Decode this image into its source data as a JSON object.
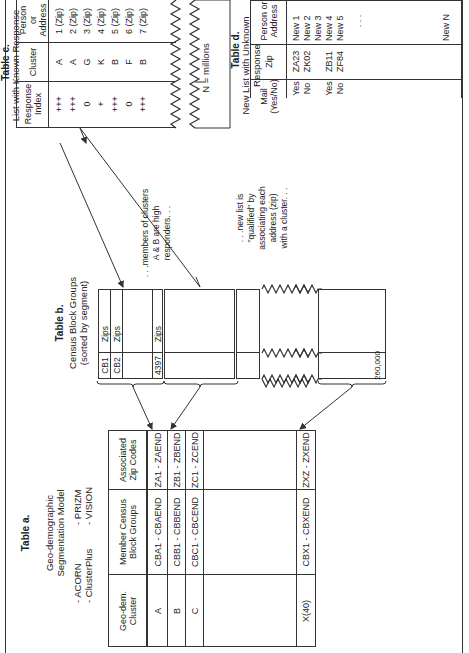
{
  "table_a": {
    "title": "Table a.",
    "subtitle_1": "Geo-demographic",
    "subtitle_2": "Segmentation Model",
    "models": [
      "- ACORN",
      "- PRIZM",
      "- ClusterPlus",
      "- VISION"
    ],
    "headers": [
      "Geo-dem. Cluster",
      "Member Census Block Groups",
      "Associated Zip Codes"
    ],
    "rows": [
      {
        "cluster": "A",
        "members": "CBA1 - CBAEND",
        "zips": "ZA1 - ZAEND"
      },
      {
        "cluster": "B",
        "members": "CBB1 - CBBEND",
        "zips": "ZB1 - ZBEND"
      },
      {
        "cluster": "C",
        "members": "CBC1 - CBCEND",
        "zips": "ZC1 - ZCEND"
      },
      {
        "cluster": "X(40)",
        "members": "CBX1 - CBXEND",
        "zips": "ZXZ - ZXEND"
      }
    ]
  },
  "table_b": {
    "title": "Table b.",
    "subtitle_1": "Census Block Groups",
    "subtitle_2": "(sorted by segment)",
    "rows": [
      {
        "id": "CB1",
        "value": "Zips"
      },
      {
        "id": "CB2",
        "value": "Zips"
      },
      {
        "id": "4397",
        "value": "Zips"
      }
    ],
    "total": "260,000"
  },
  "annotations": {
    "members_note": ". . .members of clusters A & B are high responders. . .",
    "members_lines": [
      ". . .members of clusters",
      "A & B are high",
      "responders. . ."
    ],
    "qualified_lines": [
      ". . .new list is",
      "\"qualified\" by",
      "associating each",
      "address (zip)",
      "with a cluster. . ."
    ],
    "n_millions": "N = millions"
  },
  "table_c": {
    "title": "Table c.",
    "subtitle": "List with Known Response",
    "headers": [
      "Person or Address",
      "Cluster",
      "Response Index"
    ],
    "rows": [
      {
        "person": "1 (Zip)",
        "cluster": "A",
        "index": "+++"
      },
      {
        "person": "2 (Zip)",
        "cluster": "A",
        "index": "+++"
      },
      {
        "person": "3 (Zip)",
        "cluster": "G",
        "index": "0"
      },
      {
        "person": "4 (Zip)",
        "cluster": "K",
        "index": "+"
      },
      {
        "person": "5 (Zip)",
        "cluster": "B",
        "index": "+++"
      },
      {
        "person": "6 (Zip)",
        "cluster": "F",
        "index": "0"
      },
      {
        "person": "7 (Zip)",
        "cluster": "B",
        "index": "+++"
      }
    ]
  },
  "table_d": {
    "title": "Table d.",
    "subtitle": "New List with Unknown Response",
    "headers": [
      "Person or Address",
      "Zip",
      "Mail (Yes/No)"
    ],
    "rows": [
      {
        "person": "New 1",
        "zip": "ZA23",
        "mail": "Yes"
      },
      {
        "person": "New 2",
        "zip": "ZK02",
        "mail": "No"
      },
      {
        "person": "New 3",
        "zip": "",
        "mail": ""
      },
      {
        "person": "New 4",
        "zip": "ZB11",
        "mail": "Yes"
      },
      {
        "person": "New 5",
        "zip": "ZF84",
        "mail": "No"
      }
    ],
    "ellipsis": ". . .",
    "last_row": "New N"
  }
}
